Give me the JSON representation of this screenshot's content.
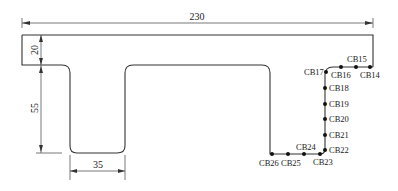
{
  "diagram": {
    "type": "cross-section",
    "dimensions": {
      "overall_width": "230",
      "flange_thickness": "20",
      "web_depth": "55",
      "web_width": "35"
    },
    "points": [
      {
        "id": "CB14",
        "label": "CB14"
      },
      {
        "id": "CB15",
        "label": "CB15"
      },
      {
        "id": "CB16",
        "label": "CB16"
      },
      {
        "id": "CB17",
        "label": "CB17"
      },
      {
        "id": "CB18",
        "label": "CB18"
      },
      {
        "id": "CB19",
        "label": "CB19"
      },
      {
        "id": "CB20",
        "label": "CB20"
      },
      {
        "id": "CB21",
        "label": "CB21"
      },
      {
        "id": "CB22",
        "label": "CB22"
      },
      {
        "id": "CB23",
        "label": "CB23"
      },
      {
        "id": "CB24",
        "label": "CB24"
      },
      {
        "id": "CB25",
        "label": "CB25"
      },
      {
        "id": "CB26",
        "label": "CB26"
      }
    ],
    "colors": {
      "outline": "#333333",
      "dimension": "#555555",
      "point": "#111111"
    }
  }
}
